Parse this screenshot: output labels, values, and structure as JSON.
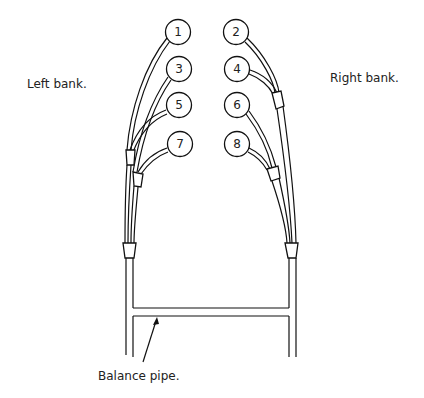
{
  "diagram": {
    "labels": {
      "left_bank": "Left bank.",
      "right_bank": "Right bank.",
      "balance_pipe": "Balance pipe."
    },
    "cylinders": [
      {
        "id": "1",
        "bank": "left",
        "cx": 178,
        "cy": 32
      },
      {
        "id": "2",
        "bank": "right",
        "cx": 236,
        "cy": 32
      },
      {
        "id": "3",
        "bank": "left",
        "cx": 179,
        "cy": 69
      },
      {
        "id": "4",
        "bank": "right",
        "cx": 237,
        "cy": 69
      },
      {
        "id": "5",
        "bank": "left",
        "cx": 179,
        "cy": 105
      },
      {
        "id": "6",
        "bank": "right",
        "cx": 237,
        "cy": 105
      },
      {
        "id": "7",
        "bank": "left",
        "cx": 180,
        "cy": 144
      },
      {
        "id": "8",
        "bank": "right",
        "cx": 237,
        "cy": 144
      }
    ],
    "colors": {
      "ink": "#111111",
      "background": "#ffffff"
    }
  }
}
